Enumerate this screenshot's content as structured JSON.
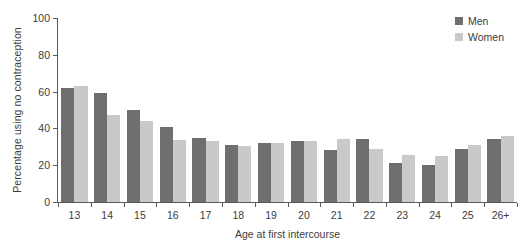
{
  "chart_data": {
    "type": "bar",
    "title": "",
    "subtitle": "",
    "xlabel": "Age at first intercourse",
    "ylabel": "Percentage using no contraception",
    "categories": [
      "13",
      "14",
      "15",
      "16",
      "17",
      "18",
      "19",
      "20",
      "21",
      "22",
      "23",
      "24",
      "25",
      "26+"
    ],
    "series": [
      {
        "name": "Men",
        "color": "#6f6f6f",
        "values": [
          62,
          59,
          50,
          41,
          35,
          31,
          32,
          33,
          28,
          34,
          21,
          20,
          29,
          34
        ]
      },
      {
        "name": "Women",
        "color": "#c9c9c9",
        "values": [
          63,
          47.5,
          44,
          33.5,
          33,
          30.5,
          32,
          33,
          34,
          29,
          25.5,
          25,
          31,
          36
        ]
      }
    ],
    "ylim": [
      0,
      100
    ],
    "ytick_values": [
      0,
      20,
      40,
      60,
      80,
      100
    ],
    "ytick_labels": [
      "0",
      "20",
      "40",
      "60",
      "80",
      "100"
    ],
    "grid": false,
    "legend_position": "top-right",
    "legend_entries": [
      {
        "label": "Men",
        "color": "#6f6f6f"
      },
      {
        "label": "Women",
        "color": "#c9c9c9"
      }
    ]
  },
  "axis": {
    "y_title": "Percentage using no contraception",
    "x_title": "Age at first intercourse"
  },
  "legend": {
    "men_label": "Men",
    "women_label": "Women"
  }
}
